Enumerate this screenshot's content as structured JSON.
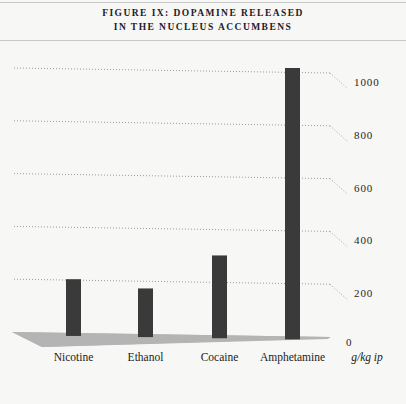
{
  "figure": {
    "title_line_1": "Figure IX: Dopamine Released",
    "title_line_2": "in the Nucleus Accumbens"
  },
  "chart_data": {
    "type": "bar",
    "title": "Figure IX: Dopamine Released in the Nucleus Accumbens",
    "xlabel": "",
    "ylabel": "",
    "unit_note": "g/kg ip",
    "categories": [
      "Nicotine",
      "Ethanol",
      "Cocaine",
      "Amphetamine"
    ],
    "values": [
      200,
      165,
      290,
      1000
    ],
    "ylim": [
      0,
      1100
    ],
    "yticks": [
      0,
      200,
      400,
      600,
      800,
      1000
    ],
    "ytick_labels": [
      "0",
      "200",
      "400",
      "600",
      "800",
      "1000"
    ],
    "grid": true,
    "grid_style": "dotted",
    "legend": false,
    "bar_color": "#3a3a3a",
    "baseline_color": "#b4b4b4",
    "background_color": "#f7f7f5",
    "rule_color": "#c9c9c9"
  }
}
